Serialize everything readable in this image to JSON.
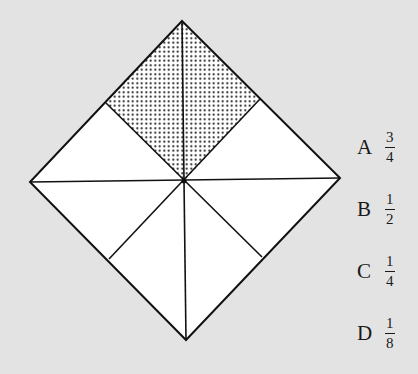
{
  "diagram": {
    "shape": "square rotated 45° (diamond) divided into 8 congruent triangles",
    "shaded_fraction_shown": "2 of 8 triangles",
    "colors": {
      "background": "#e3e3e3",
      "fill": "#ffffff",
      "stroke": "#111111",
      "shading": "dot pattern"
    }
  },
  "options": [
    {
      "letter": "A",
      "numerator": "3",
      "denominator": "4"
    },
    {
      "letter": "B",
      "numerator": "1",
      "denominator": "2"
    },
    {
      "letter": "C",
      "numerator": "1",
      "denominator": "4"
    },
    {
      "letter": "D",
      "numerator": "1",
      "denominator": "8"
    }
  ]
}
